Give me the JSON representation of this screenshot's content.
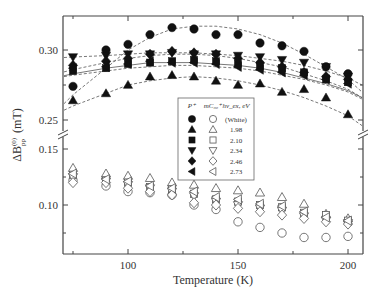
{
  "chart_data": {
    "type": "scatter",
    "title": "",
    "xlabel": "Temperature  (K)",
    "ylabel": "ΔB",
    "ylabel_sup": "(0)",
    "ylabel_sub": "pp",
    "ylabel_unit": "(mT)",
    "xlim": [
      70,
      210
    ],
    "x_ticks": [
      100,
      150,
      200
    ],
    "x_tick_labels": [
      "100",
      "150",
      "200"
    ],
    "x_minor_ticks": [
      75,
      125,
      175
    ],
    "upper_panel": {
      "ylim": [
        0.24,
        0.323
      ],
      "y_ticks": [
        0.25,
        0.3
      ],
      "y_tick_labels": [
        "0.25",
        "0.30"
      ]
    },
    "lower_panel": {
      "ylim": [
        0.06,
        0.15
      ],
      "y_ticks": [
        0.1,
        0.15
      ],
      "y_tick_labels": [
        "0.10",
        "0.15"
      ],
      "y_minor_ticks": [
        0.075,
        0.125
      ]
    },
    "axis_break": "between 0.15 and 0.25",
    "grid": false,
    "x": [
      75,
      90,
      100,
      110,
      120,
      130,
      140,
      150,
      160,
      170,
      180,
      190,
      200
    ],
    "series": [
      {
        "name": "P+ White",
        "panel": "upper",
        "marker": "circle",
        "filled": true,
        "values": [
          0.274,
          0.3,
          0.304,
          0.311,
          0.316,
          0.315,
          0.311,
          0.311,
          0.305,
          0.303,
          0.299,
          0.288,
          0.283
        ]
      },
      {
        "name": "P+ 1.98 eV",
        "panel": "upper",
        "marker": "triangle-up",
        "filled": true,
        "values": [
          0.264,
          0.269,
          0.275,
          0.281,
          0.282,
          0.281,
          0.278,
          0.275,
          0.276,
          0.27,
          0.272,
          0.266,
          0.254
        ]
      },
      {
        "name": "P+ 2.10 eV",
        "panel": "upper",
        "marker": "square",
        "filled": true,
        "values": [
          0.285,
          0.287,
          0.29,
          0.291,
          0.292,
          0.293,
          0.292,
          0.29,
          0.288,
          0.287,
          0.284,
          0.279,
          0.277
        ]
      },
      {
        "name": "P+ 2.34 eV",
        "panel": "upper",
        "marker": "triangle-down",
        "filled": true,
        "values": [
          0.295,
          0.296,
          0.297,
          0.297,
          0.298,
          0.297,
          0.297,
          0.296,
          0.295,
          0.293,
          0.291,
          0.288,
          0.281
        ]
      },
      {
        "name": "P+ 2.46 eV",
        "panel": "upper",
        "marker": "diamond",
        "filled": true,
        "values": [
          0.289,
          0.292,
          0.294,
          0.297,
          0.299,
          0.298,
          0.297,
          0.294,
          0.291,
          0.288,
          0.284,
          0.281,
          0.279
        ]
      },
      {
        "name": "P+ 2.73 eV",
        "panel": "upper",
        "marker": "triangle-left",
        "filled": true,
        "values": [
          0.287,
          0.288,
          0.29,
          0.292,
          0.291,
          0.291,
          0.29,
          0.288,
          0.286,
          0.284,
          0.282,
          0.279,
          0.276
        ]
      },
      {
        "name": "mC60 White",
        "panel": "lower",
        "marker": "circle",
        "filled": false,
        "values": [
          0.122,
          0.117,
          0.112,
          0.111,
          0.109,
          0.1,
          0.096,
          0.085,
          0.08,
          0.075,
          0.071,
          0.071,
          0.072
        ]
      },
      {
        "name": "mC60 1.98 eV",
        "panel": "lower",
        "marker": "triangle-up",
        "filled": false,
        "values": [
          0.133,
          0.128,
          0.126,
          0.124,
          0.12,
          0.118,
          0.115,
          0.113,
          0.111,
          0.107,
          0.101,
          0.092,
          0.088
        ]
      },
      {
        "name": "mC60 2.10 eV",
        "panel": "lower",
        "marker": "square",
        "filled": false,
        "values": [
          0.127,
          0.122,
          0.12,
          0.116,
          0.114,
          0.11,
          0.105,
          0.103,
          0.1,
          0.098,
          0.093,
          0.091,
          0.086
        ]
      },
      {
        "name": "mC60 2.34 eV",
        "panel": "lower",
        "marker": "triangle-down",
        "filled": false,
        "values": [
          0.125,
          0.121,
          0.118,
          0.115,
          0.112,
          0.108,
          0.103,
          0.1,
          0.097,
          0.095,
          0.09,
          0.086,
          0.084
        ]
      },
      {
        "name": "mC60 2.46 eV",
        "panel": "lower",
        "marker": "diamond",
        "filled": false,
        "values": [
          0.12,
          0.12,
          0.115,
          0.112,
          0.109,
          0.102,
          0.1,
          0.097,
          0.094,
          0.091,
          0.088,
          0.085,
          0.083
        ]
      },
      {
        "name": "mC60 2.73 eV",
        "panel": "lower",
        "marker": "triangle-left",
        "filled": false,
        "values": [
          0.128,
          0.123,
          0.121,
          0.117,
          0.115,
          0.112,
          0.107,
          0.105,
          0.101,
          0.099,
          0.094,
          0.089,
          0.086
        ]
      }
    ],
    "fits": [
      {
        "series": "P+ White",
        "style": "dashed",
        "values": [
          0.268,
          0.287,
          0.3,
          0.309,
          0.315,
          0.317,
          0.317,
          0.315,
          0.311,
          0.305,
          0.297,
          0.288,
          0.279
        ]
      },
      {
        "series": "P+ 1.98 eV",
        "style": "dashed",
        "values": [
          0.26,
          0.269,
          0.275,
          0.278,
          0.28,
          0.281,
          0.28,
          0.278,
          0.275,
          0.271,
          0.266,
          0.26,
          0.253
        ]
      },
      {
        "series": "P+ 2.10 eV",
        "style": "solid",
        "values": [
          0.283,
          0.287,
          0.289,
          0.291,
          0.291,
          0.291,
          0.29,
          0.289,
          0.287,
          0.284,
          0.28,
          0.276,
          0.271
        ]
      },
      {
        "series": "P+ 2.34 eV",
        "style": "dashed",
        "values": [
          0.295,
          0.296,
          0.297,
          0.298,
          0.298,
          0.298,
          0.297,
          0.296,
          0.294,
          0.292,
          0.289,
          0.285,
          0.28
        ]
      },
      {
        "series": "P+ 2.46 eV",
        "style": "dashed",
        "values": [
          0.286,
          0.291,
          0.294,
          0.296,
          0.297,
          0.297,
          0.296,
          0.294,
          0.291,
          0.288,
          0.283,
          0.278,
          0.272
        ]
      },
      {
        "series": "P+ 2.73 eV",
        "style": "dashed",
        "values": [
          0.282,
          0.285,
          0.287,
          0.288,
          0.289,
          0.289,
          0.288,
          0.287,
          0.285,
          0.282,
          0.279,
          0.275,
          0.27
        ]
      }
    ],
    "legend": {
      "placement": "center",
      "headers": [
        "P⁺",
        "mC₆₀⁺",
        "hν_ex, eV"
      ],
      "rows": [
        {
          "marker": "circle",
          "label": "(White)"
        },
        {
          "marker": "triangle-up",
          "label": "1.98"
        },
        {
          "marker": "square",
          "label": "2.10"
        },
        {
          "marker": "triangle-down",
          "label": "2.34"
        },
        {
          "marker": "diamond",
          "label": "2.46"
        },
        {
          "marker": "triangle-left",
          "label": "2.73"
        }
      ]
    }
  }
}
